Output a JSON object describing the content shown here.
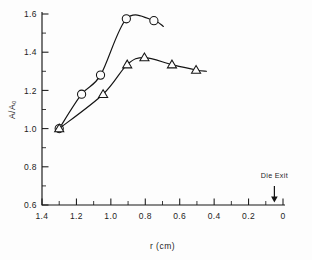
{
  "chart_data": {
    "type": "line",
    "title": "",
    "xlabel": "r (cm)",
    "ylabel": "A/A₀",
    "xlim": [
      1.4,
      0.0
    ],
    "ylim": [
      0.6,
      1.6
    ],
    "x_reversed": true,
    "grid": false,
    "legend": "none",
    "x_ticks": [
      "1.4",
      "1.2",
      "1.0",
      "0.8",
      "0.6",
      "0.4",
      "0.2",
      "0"
    ],
    "x_tick_values": [
      1.4,
      1.2,
      1.0,
      0.8,
      0.6,
      0.4,
      0.2,
      0.0
    ],
    "x_minor_values": [
      1.3,
      1.1,
      0.9,
      0.7,
      0.5,
      0.3,
      0.1
    ],
    "y_ticks": [
      "0.6",
      "0.8",
      "1.0",
      "1.2",
      "1.4",
      "1.6"
    ],
    "y_tick_values": [
      0.6,
      0.8,
      1.0,
      1.2,
      1.4,
      1.6
    ],
    "y_minor_values": [
      0.7,
      0.9,
      1.1,
      1.3,
      1.5
    ],
    "series": [
      {
        "name": "circles",
        "marker": "circle",
        "x": [
          1.3,
          1.17,
          1.06,
          0.91,
          0.75
        ],
        "values": [
          1.0,
          1.18,
          1.28,
          1.575,
          1.565
        ],
        "curve_tail_x": 0.695,
        "curve_tail_y": 1.535
      },
      {
        "name": "triangles",
        "marker": "triangle",
        "x": [
          1.3,
          1.045,
          0.905,
          0.805,
          0.645,
          0.505
        ],
        "values": [
          1.0,
          1.18,
          1.335,
          1.372,
          1.335,
          1.307
        ],
        "curve_tail_x": 0.445,
        "curve_tail_y": 1.3
      }
    ],
    "annotations": [
      {
        "text": "Die Exit",
        "x": 0.05,
        "arrow": "down",
        "arrow_top_y": 0.7,
        "arrow_tip_y": 0.613
      }
    ]
  }
}
